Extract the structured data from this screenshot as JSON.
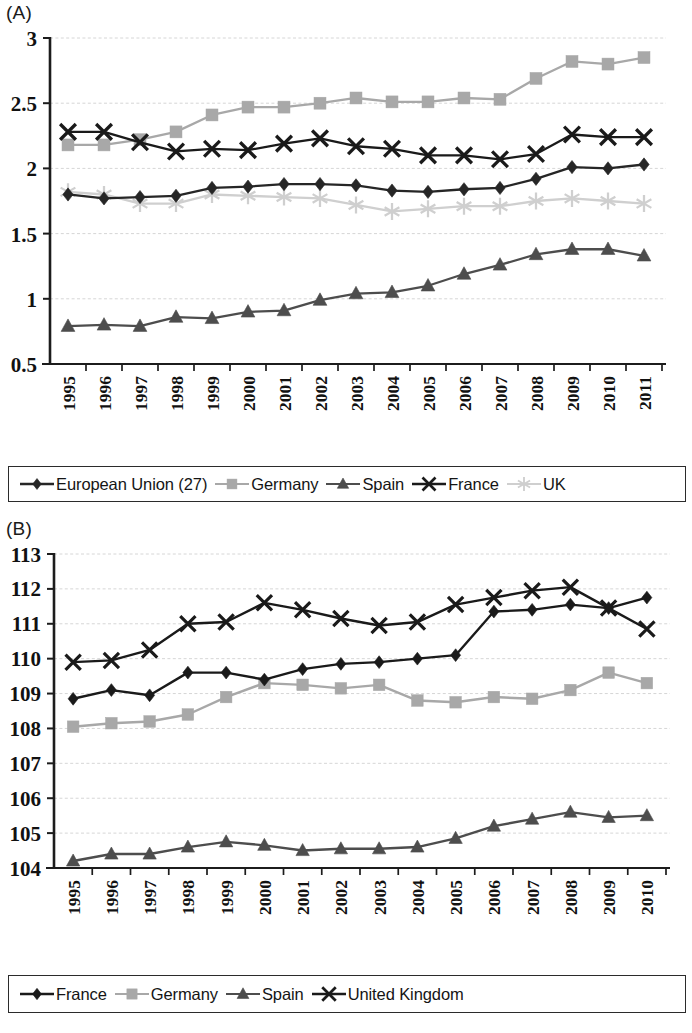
{
  "panels": {
    "a": {
      "label": "(A)",
      "legend": [
        {
          "name": "European Union (27)",
          "marker": "diamond",
          "color": "#262626"
        },
        {
          "name": "Germany",
          "marker": "square",
          "color": "#a8a8a8"
        },
        {
          "name": "Spain",
          "marker": "triangle",
          "color": "#4d4d4d"
        },
        {
          "name": "France",
          "marker": "cross",
          "color": "#1a1a1a"
        },
        {
          "name": "UK",
          "marker": "asterisk",
          "color": "#cfcfcf"
        }
      ]
    },
    "b": {
      "label": "(B)",
      "legend": [
        {
          "name": "France",
          "marker": "diamond",
          "color": "#1a1a1a"
        },
        {
          "name": "Germany",
          "marker": "square",
          "color": "#a8a8a8"
        },
        {
          "name": "Spain",
          "marker": "triangle",
          "color": "#4d4d4d"
        },
        {
          "name": "United Kingdom",
          "marker": "cross",
          "color": "#1a1a1a"
        }
      ]
    }
  },
  "chart_data": [
    {
      "type": "line",
      "id": "A",
      "title": "(A)",
      "xlabel": "",
      "ylabel": "",
      "grid": true,
      "legend_position": "bottom",
      "x": [
        1995,
        1996,
        1997,
        1998,
        1999,
        2000,
        2001,
        2002,
        2003,
        2004,
        2005,
        2006,
        2007,
        2008,
        2009,
        2010,
        2011
      ],
      "categories": [
        "1995",
        "1996",
        "1997",
        "1998",
        "1999",
        "2000",
        "2001",
        "2002",
        "2003",
        "2004",
        "2005",
        "2006",
        "2007",
        "2008",
        "2009",
        "2010",
        "2011"
      ],
      "ylim": [
        0.5,
        3
      ],
      "yticks": [
        0.5,
        1,
        1.5,
        2,
        2.5,
        3
      ],
      "ytick_labels": [
        "0.5",
        "1",
        "1.5",
        "2",
        "2.5",
        "3"
      ],
      "series": [
        {
          "name": "European Union (27)",
          "marker": "diamond",
          "color": "#262626",
          "values": [
            1.8,
            1.77,
            1.78,
            1.79,
            1.85,
            1.86,
            1.88,
            1.88,
            1.87,
            1.83,
            1.82,
            1.84,
            1.85,
            1.92,
            2.01,
            2.0,
            2.03
          ]
        },
        {
          "name": "Germany",
          "marker": "square",
          "color": "#a8a8a8",
          "values": [
            2.18,
            2.18,
            2.22,
            2.28,
            2.41,
            2.47,
            2.47,
            2.5,
            2.54,
            2.51,
            2.51,
            2.54,
            2.53,
            2.69,
            2.82,
            2.8,
            2.85
          ]
        },
        {
          "name": "Spain",
          "marker": "triangle",
          "color": "#4d4d4d",
          "values": [
            0.79,
            0.8,
            0.79,
            0.86,
            0.85,
            0.9,
            0.91,
            0.99,
            1.04,
            1.05,
            1.1,
            1.19,
            1.26,
            1.34,
            1.38,
            1.38,
            1.33
          ]
        },
        {
          "name": "France",
          "marker": "cross",
          "color": "#1a1a1a",
          "values": [
            2.28,
            2.28,
            2.2,
            2.13,
            2.15,
            2.14,
            2.19,
            2.23,
            2.17,
            2.15,
            2.1,
            2.1,
            2.07,
            2.11,
            2.26,
            2.24,
            2.24
          ]
        },
        {
          "name": "UK",
          "marker": "asterisk",
          "color": "#cfcfcf",
          "values": [
            1.82,
            1.8,
            1.73,
            1.73,
            1.8,
            1.79,
            1.78,
            1.77,
            1.72,
            1.67,
            1.69,
            1.71,
            1.71,
            1.75,
            1.77,
            1.75,
            1.73
          ]
        }
      ]
    },
    {
      "type": "line",
      "id": "B",
      "title": "(B)",
      "xlabel": "",
      "ylabel": "",
      "grid": true,
      "legend_position": "bottom",
      "x": [
        1995,
        1996,
        1997,
        1998,
        1999,
        2000,
        2001,
        2002,
        2003,
        2004,
        2005,
        2006,
        2007,
        2008,
        2009,
        2010
      ],
      "categories": [
        "1995",
        "1996",
        "1997",
        "1998",
        "1999",
        "2000",
        "2001",
        "2002",
        "2003",
        "2004",
        "2005",
        "2006",
        "2007",
        "2008",
        "2009",
        "2010"
      ],
      "ylim": [
        104,
        113
      ],
      "yticks": [
        104,
        105,
        106,
        107,
        108,
        109,
        110,
        111,
        112,
        113
      ],
      "ytick_labels": [
        "104",
        "105",
        "106",
        "107",
        "108",
        "109",
        "110",
        "111",
        "112",
        "113"
      ],
      "series": [
        {
          "name": "France",
          "marker": "diamond",
          "color": "#1a1a1a",
          "values": [
            108.85,
            109.1,
            108.95,
            109.6,
            109.6,
            109.4,
            109.7,
            109.85,
            109.9,
            110.0,
            110.1,
            111.35,
            111.4,
            111.55,
            111.45,
            111.75
          ]
        },
        {
          "name": "Germany",
          "marker": "square",
          "color": "#a8a8a8",
          "values": [
            108.05,
            108.15,
            108.2,
            108.4,
            108.9,
            109.3,
            109.25,
            109.15,
            109.25,
            108.8,
            108.75,
            108.9,
            108.85,
            109.1,
            109.6,
            109.3
          ]
        },
        {
          "name": "Spain",
          "marker": "triangle",
          "color": "#4d4d4d",
          "values": [
            104.2,
            104.4,
            104.4,
            104.6,
            104.75,
            104.65,
            104.5,
            104.55,
            104.55,
            104.6,
            104.85,
            105.2,
            105.4,
            105.6,
            105.45,
            105.5
          ]
        },
        {
          "name": "United Kingdom",
          "marker": "cross",
          "color": "#1a1a1a",
          "values": [
            109.9,
            109.95,
            110.25,
            111.0,
            111.05,
            111.6,
            111.4,
            111.15,
            110.95,
            111.05,
            111.55,
            111.75,
            111.95,
            112.05,
            111.45,
            110.85
          ]
        }
      ]
    }
  ]
}
